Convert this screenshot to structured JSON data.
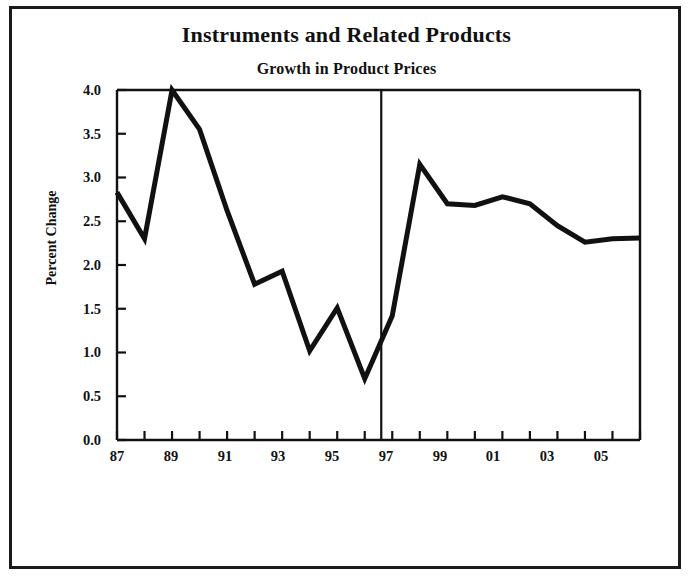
{
  "figure": {
    "title": "Instruments and Related Products",
    "subtitle": "Growth in Product Prices"
  },
  "chart_data": {
    "type": "line",
    "title": "Instruments and Related Products",
    "subtitle": "Growth in Product Prices",
    "xlabel": "",
    "ylabel": "Percent Change",
    "ylim": [
      0.0,
      4.0
    ],
    "xlim": [
      87,
      106
    ],
    "grid": false,
    "legend": null,
    "y_ticks": [
      "0.0",
      "0.5",
      "1.0",
      "1.5",
      "2.0",
      "2.5",
      "3.0",
      "3.5",
      "4.0"
    ],
    "y_tick_values": [
      0.0,
      0.5,
      1.0,
      1.5,
      2.0,
      2.5,
      3.0,
      3.5,
      4.0
    ],
    "x_tick_labels": [
      "87",
      "89",
      "91",
      "93",
      "95",
      "97",
      "99",
      "01",
      "03",
      "05"
    ],
    "x_tick_values": [
      87,
      89,
      91,
      93,
      95,
      97,
      99,
      101,
      103,
      105
    ],
    "x_minor_ticks": [
      87,
      88,
      89,
      90,
      91,
      92,
      93,
      94,
      95,
      96,
      97,
      98,
      99,
      100,
      101,
      102,
      103,
      104,
      105,
      106
    ],
    "x": [
      87,
      88,
      89,
      90,
      91,
      92,
      93,
      94,
      95,
      96,
      97,
      98,
      99,
      100,
      101,
      102,
      103,
      104,
      105,
      106
    ],
    "values": [
      2.83,
      2.3,
      4.0,
      3.55,
      2.62,
      1.78,
      1.93,
      1.02,
      1.51,
      0.7,
      1.42,
      3.15,
      2.7,
      2.68,
      2.78,
      2.7,
      2.45,
      2.26,
      2.3,
      2.31
    ],
    "annotations": [
      {
        "name": "forecast-divider",
        "type": "vline",
        "x": 96.6,
        "note": "vertical rule separating history from projection"
      }
    ],
    "line_color": "#111111",
    "line_width": 5,
    "axis_color": "#111111",
    "background": "#ffffff"
  }
}
